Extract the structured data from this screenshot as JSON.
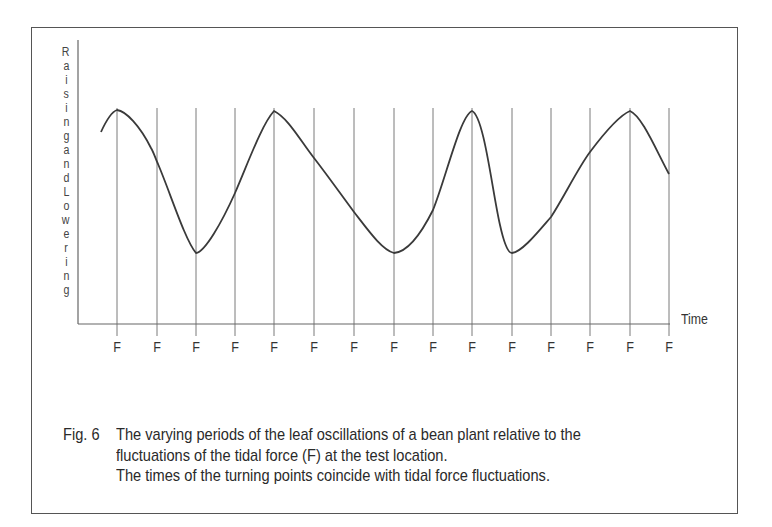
{
  "figure": {
    "number_label": "Fig. 6",
    "caption_lines": [
      "The varying periods of the leaf oscillations of a bean plant relative to the",
      "fluctuations of the tidal force (F) at the test location.",
      "The times of the turning points coincide with tidal force fluctuations."
    ]
  },
  "chart_data": {
    "type": "line",
    "title": "",
    "xlabel": "Time",
    "ylabel": "Raising and Lowering",
    "ylabel_letters": [
      "R",
      "a",
      "i",
      "s",
      "i",
      "n",
      "g",
      "a",
      "n",
      "d",
      "L",
      "o",
      "w",
      "e",
      "r",
      "i",
      "n",
      "g"
    ],
    "x_tick_labels": [
      "F",
      "F",
      "F",
      "F",
      "F",
      "F",
      "F",
      "F",
      "F",
      "F",
      "F",
      "F",
      "F",
      "F",
      "F"
    ],
    "x_tick_positions": [
      117,
      157,
      196,
      235,
      274,
      314,
      354,
      394,
      433,
      472,
      512,
      551,
      590,
      630,
      669
    ],
    "grid": "vertical lines at each F tick",
    "legend": "none",
    "series": [
      {
        "name": "Leaf oscillation",
        "description": "Relative raising (up) / lowering (down) of bean-plant leaf; turning points coincide with F ticks",
        "points_relative": [
          {
            "tick_index": -0.4,
            "value": 0.85
          },
          {
            "tick_index": 0,
            "value": 1.0
          },
          {
            "tick_index": 1,
            "value": 0.63
          },
          {
            "tick_index": 2,
            "value": 0.0
          },
          {
            "tick_index": 3,
            "value": 0.42
          },
          {
            "tick_index": 4,
            "value": 1.0
          },
          {
            "tick_index": 5,
            "value": 0.67
          },
          {
            "tick_index": 6,
            "value": 0.27
          },
          {
            "tick_index": 7,
            "value": 0.0
          },
          {
            "tick_index": 8,
            "value": 0.42
          },
          {
            "tick_index": 9,
            "value": 1.0
          },
          {
            "tick_index": 10,
            "value": 0.0
          },
          {
            "tick_index": 11,
            "value": 0.37
          },
          {
            "tick_index": 12,
            "value": 0.72
          },
          {
            "tick_index": 13,
            "value": 1.0
          },
          {
            "tick_index": 14,
            "value": 0.56
          }
        ],
        "turning_points": [
          {
            "type": "peak",
            "tick_index": 0
          },
          {
            "type": "trough",
            "tick_index": 2
          },
          {
            "type": "peak",
            "tick_index": 4
          },
          {
            "type": "trough",
            "tick_index": 7
          },
          {
            "type": "peak",
            "tick_index": 9
          },
          {
            "type": "trough",
            "tick_index": 10
          },
          {
            "type": "peak",
            "tick_index": 13
          }
        ]
      }
    ]
  },
  "colors": {
    "curve": "#3a3a3a",
    "grid": "#7a7a7a",
    "axis": "#555555",
    "frame": "#555555",
    "text": "#2a2a2a"
  }
}
